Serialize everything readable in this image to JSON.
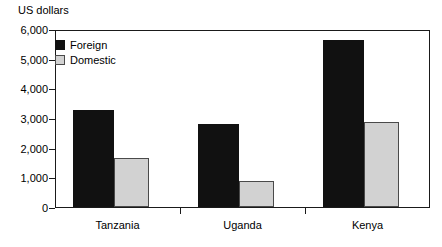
{
  "chart_data": {
    "type": "bar",
    "title": "",
    "ylabel": "US dollars",
    "xlabel": "",
    "categories": [
      "Tanzania",
      "Uganda",
      "Kenya"
    ],
    "series": [
      {
        "name": "Foreign",
        "color": "#111111",
        "values": [
          3270,
          2800,
          5630
        ]
      },
      {
        "name": "Domestic",
        "color": "#d2d2d2",
        "values": [
          1650,
          880,
          2860
        ]
      }
    ],
    "ylim": [
      0,
      6000
    ],
    "yticks": [
      0,
      1000,
      2000,
      3000,
      4000,
      5000,
      6000
    ],
    "ytick_labels": [
      "0",
      "1,000",
      "2,000",
      "3,000",
      "4,000",
      "5,000",
      "6,000"
    ],
    "grid": false,
    "legend_position": "top-left"
  },
  "legend": {
    "items": [
      {
        "label": "Foreign"
      },
      {
        "label": "Domestic"
      }
    ]
  },
  "axis": {
    "y_title": "US dollars"
  }
}
